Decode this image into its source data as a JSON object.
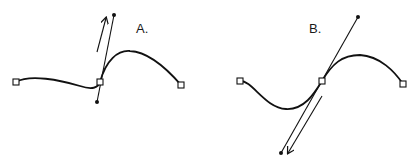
{
  "diagrams": [
    {
      "label": "A.",
      "description": "Bezier curve with direction handle dragged upward; curve bends sharply at the middle anchor",
      "anchors": [
        [
          16,
          82
        ],
        [
          100,
          82
        ],
        [
          181,
          85
        ]
      ],
      "handle": {
        "start": [
          97,
          102
        ],
        "end": [
          114,
          15
        ]
      },
      "arrow": {
        "from": [
          97,
          52
        ],
        "to": [
          106,
          18
        ],
        "direction": "up"
      }
    },
    {
      "label": "B.",
      "description": "Bezier curve with direction handle dragged downward-left; smooth S-curve through the middle anchor",
      "anchors": [
        [
          240,
          81
        ],
        [
          322,
          81
        ],
        [
          403,
          84
        ]
      ],
      "handle": {
        "start": [
          281,
          153
        ],
        "end": [
          358,
          17
        ]
      },
      "arrow": {
        "from": [
          322,
          96
        ],
        "to": [
          287,
          154
        ],
        "direction": "down"
      }
    }
  ],
  "colors": {
    "stroke": "#111111",
    "anchor_fill": "#ffffff",
    "background": "#ffffff"
  }
}
